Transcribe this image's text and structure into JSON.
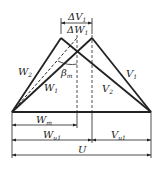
{
  "labels": {
    "dV": "ΔV",
    "dV_sub": "1",
    "dW": "ΔW",
    "dW_sub": "1",
    "W2": "W",
    "W2_sub": "2",
    "W1": "W",
    "W1_sub": "1",
    "V1": "V",
    "V1_sub": "1",
    "V2": "V",
    "V2_sub": "2",
    "beta": "β",
    "beta_sub": "m",
    "Wm": "W",
    "Wm_sub": "m",
    "Wu1": "W",
    "Wu1_sub": "u1",
    "Vu1": "V",
    "Vu1_sub": "u1",
    "U": "U"
  }
}
